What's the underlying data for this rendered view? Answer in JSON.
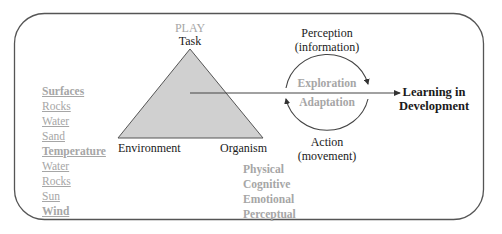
{
  "diagram": {
    "triangle": {
      "top_label_play": "PLAY",
      "top_label_task": "Task",
      "left_label": "Environment",
      "right_label": "Organism",
      "fill_color": "#d0d0d0",
      "stroke_color": "#555555"
    },
    "cycle": {
      "top_label_line1": "Perception",
      "top_label_line2": "(information)",
      "inner_upper": "Exploration",
      "inner_lower": "Adaptation",
      "bottom_label_line1": "Action",
      "bottom_label_line2": "(movement)"
    },
    "outcome": {
      "line1": "Learning in",
      "line2": "Development"
    },
    "environment_list": {
      "items": [
        {
          "label": "Surfaces",
          "style": "heading"
        },
        {
          "label": "Rocks",
          "style": "item"
        },
        {
          "label": "Water",
          "style": "item"
        },
        {
          "label": "Sand",
          "style": "item"
        },
        {
          "label": "Temperature",
          "style": "heading"
        },
        {
          "label": "Water",
          "style": "item"
        },
        {
          "label": "Rocks",
          "style": "item"
        },
        {
          "label": "Sun",
          "style": "item"
        },
        {
          "label": "Wind",
          "style": "heading"
        }
      ]
    },
    "organism_list": {
      "items": [
        "Physical",
        "Cognitive",
        "Emotional",
        "Perceptual"
      ]
    },
    "colors": {
      "text_dark": "#1a1a1a",
      "text_gray": "#a6a6a6",
      "line": "#444444",
      "frame": "#555555"
    }
  }
}
